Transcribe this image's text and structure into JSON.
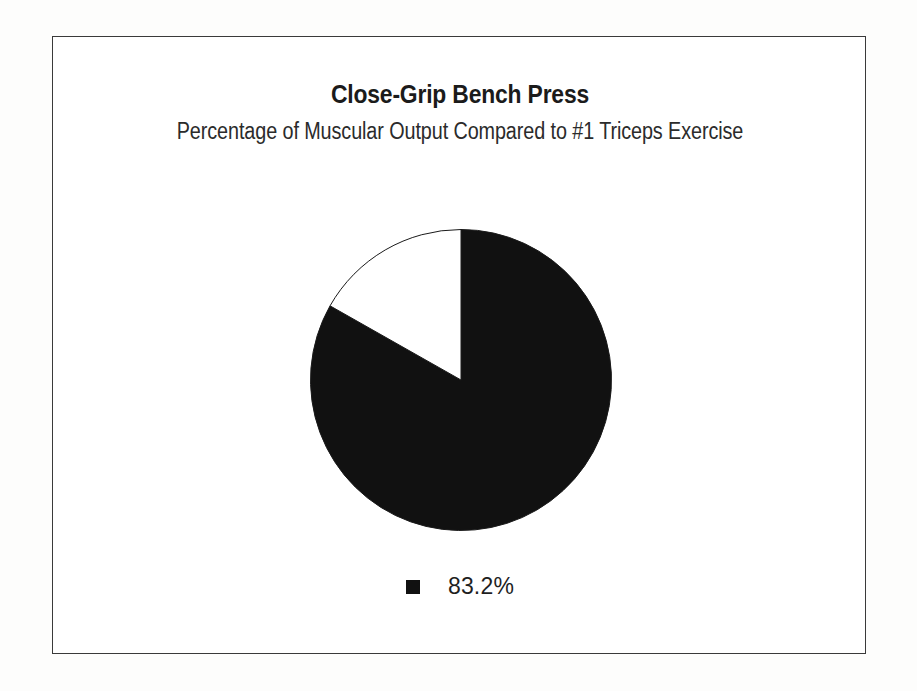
{
  "chart_data": {
    "type": "pie",
    "title": "Close-Grip Bench Press",
    "subtitle": "Percentage of Muscular Output Compared to #1 Triceps Exercise",
    "categories": [
      "83.2%",
      "Remainder"
    ],
    "values": [
      83.2,
      16.8
    ],
    "value_unit": "%",
    "colors": [
      "#111111",
      "#ffffff"
    ],
    "legend": {
      "position": "bottom",
      "entries": [
        {
          "label": "83.2%",
          "color": "#111111"
        }
      ]
    },
    "start_angle_deg": 0,
    "direction": "clockwise",
    "slices": [
      {
        "label": "83.2%",
        "value": 83.2,
        "sweep_deg": 299.5,
        "color": "#111111",
        "outlined": true
      },
      {
        "label": "",
        "value": 16.8,
        "sweep_deg": 60.5,
        "color": "#ffffff",
        "outlined": true
      }
    ],
    "grid": false,
    "xlabel": "",
    "ylabel": ""
  },
  "frame": {
    "border_color": "#3a3a3a"
  }
}
